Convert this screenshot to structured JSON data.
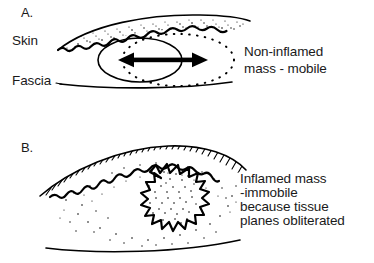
{
  "figure": {
    "type": "medical-line-diagram",
    "background_color": "#ffffff",
    "ink_color": "#000000",
    "width": 374,
    "height": 263
  },
  "panel_a": {
    "label": "A.",
    "anatomy_labels": [
      {
        "name": "skin",
        "text": "Skin"
      },
      {
        "name": "fascia",
        "text": "Fascia"
      }
    ],
    "callout_lines": [
      "Non-inflamed",
      "mass - mobile"
    ],
    "annotations": {
      "arrow": "double-headed-horizontal-arrow",
      "arrow_meaning": "mass is mobile / slides within tissue plane",
      "mass_outline": "smooth-ellipse",
      "tissue_plane_outline": "dotted-ellipse",
      "skin_band_texture": "stippled"
    }
  },
  "panel_b": {
    "label": "B.",
    "anatomy_labels": [],
    "callout_lines": [
      "Inflamed mass",
      "-immobile",
      "because tissue",
      "planes obliterated"
    ],
    "annotations": {
      "mass_outline": "spiky-starburst",
      "mass_fill": "dense-stipple",
      "surrounding_fill": "sparse-stipple",
      "skin_band_texture": "hatched",
      "arrow": "none"
    }
  }
}
